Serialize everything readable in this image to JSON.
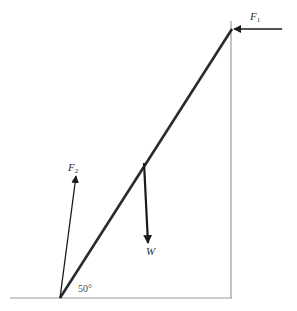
{
  "diagram": {
    "labels": {
      "f1_main": "F",
      "f1_sub": "1",
      "f2_main": "F",
      "f2_sub": "2",
      "weight": "W",
      "angle": "50°"
    },
    "colors": {
      "ladder": "#2a2a2a",
      "arrows": "#1a1a1a",
      "wall_floor": "#9a9a9a",
      "background": "#ffffff"
    },
    "elements": {
      "floor": {
        "x1": 10,
        "y1": 298,
        "x2": 232,
        "y2": 298
      },
      "wall": {
        "x1": 231,
        "y1": 21,
        "x2": 231,
        "y2": 298
      },
      "ladder": {
        "x1": 60,
        "y1": 298,
        "x2": 232,
        "y2": 29
      },
      "force_f1": {
        "x1": 282,
        "y1": 29,
        "x2": 233,
        "y2": 29,
        "direction": "left"
      },
      "force_f2": {
        "x1": 60,
        "y1": 298,
        "x2": 76,
        "y2": 176,
        "direction": "up-right"
      },
      "force_w": {
        "x1": 144,
        "y1": 163,
        "x2": 148,
        "y2": 243,
        "direction": "down"
      }
    }
  }
}
